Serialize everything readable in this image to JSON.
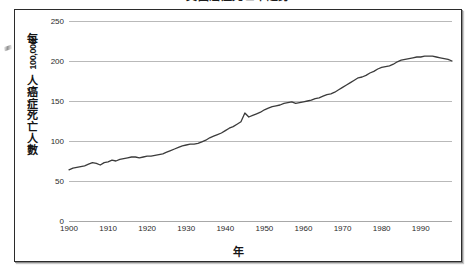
{
  "chart_data": {
    "type": "line",
    "title": "美國癌症死亡率趨勢",
    "xlabel": "年",
    "ylabel": "每 100,000 人癌症死亡人數",
    "ylabel_chars": [
      "每",
      "100,000",
      "人",
      "癌",
      "症",
      "死",
      "亡",
      "人",
      "數"
    ],
    "grid": true,
    "legend": "none",
    "xlim": [
      1900,
      1998
    ],
    "ylim": [
      0,
      250
    ],
    "yticks": [
      0,
      50,
      100,
      150,
      200,
      250
    ],
    "xticks": [
      1900,
      1910,
      1920,
      1930,
      1940,
      1950,
      1960,
      1970,
      1980,
      1990
    ],
    "series": [
      {
        "name": "每 100,000 人癌症死亡人數",
        "color": "#3b3b3b",
        "x": [
          1900,
          1901,
          1902,
          1903,
          1904,
          1905,
          1906,
          1907,
          1908,
          1909,
          1910,
          1911,
          1912,
          1913,
          1914,
          1915,
          1916,
          1917,
          1918,
          1919,
          1920,
          1921,
          1922,
          1923,
          1924,
          1925,
          1926,
          1927,
          1928,
          1929,
          1930,
          1931,
          1932,
          1933,
          1934,
          1935,
          1936,
          1937,
          1938,
          1939,
          1940,
          1941,
          1942,
          1943,
          1944,
          1945,
          1946,
          1947,
          1948,
          1949,
          1950,
          1951,
          1952,
          1953,
          1954,
          1955,
          1956,
          1957,
          1958,
          1959,
          1960,
          1961,
          1962,
          1963,
          1964,
          1965,
          1966,
          1967,
          1968,
          1969,
          1970,
          1971,
          1972,
          1973,
          1974,
          1975,
          1976,
          1977,
          1978,
          1979,
          1980,
          1981,
          1982,
          1983,
          1984,
          1985,
          1986,
          1987,
          1988,
          1989,
          1990,
          1991,
          1992,
          1993,
          1994,
          1995,
          1996,
          1997,
          1998
        ],
        "y": [
          64,
          66,
          67,
          68,
          69,
          71,
          73,
          72,
          70,
          73,
          74,
          76,
          75,
          77,
          78,
          79,
          80,
          80,
          79,
          80,
          81,
          81,
          82,
          83,
          84,
          86,
          88,
          90,
          92,
          94,
          95,
          96,
          96,
          97,
          99,
          101,
          104,
          106,
          108,
          110,
          113,
          116,
          118,
          121,
          124,
          135,
          130,
          132,
          134,
          136,
          139,
          141,
          143,
          144,
          145,
          147,
          148,
          149,
          147,
          148,
          149,
          150,
          151,
          153,
          154,
          156,
          158,
          159,
          161,
          164,
          167,
          170,
          173,
          176,
          179,
          180,
          182,
          185,
          187,
          190,
          192,
          193,
          194,
          196,
          199,
          201,
          202,
          203,
          204,
          205,
          205,
          206,
          206,
          206,
          205,
          204,
          203,
          202,
          200
        ]
      }
    ]
  },
  "figure": {
    "border_color": "#2b2b2b",
    "grid_color": "#b9b9b9",
    "line_color": "#3b3b3b",
    "background": "#ffffff"
  }
}
